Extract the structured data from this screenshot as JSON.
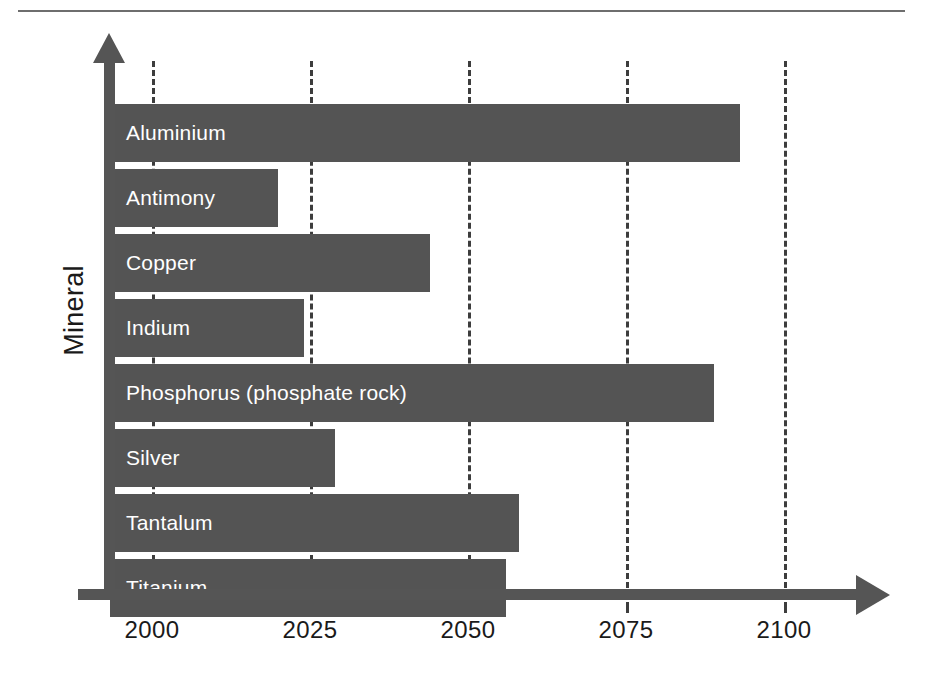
{
  "figure": {
    "background_color": "#ffffff",
    "bar_color": "#545454",
    "axis_color": "#555555",
    "grid_color": "#3d3d3d",
    "label_color": "#ffffff",
    "tick_label_color": "#1a1a1a",
    "top_rule": "divider"
  },
  "axes": {
    "y_title": "Mineral",
    "x_ticks": [
      "2000",
      "2025",
      "2050",
      "2075",
      "2100"
    ]
  },
  "chart_data": {
    "type": "bar",
    "orientation": "horizontal",
    "title": "",
    "xlabel": "",
    "ylabel": "Mineral",
    "xlim": [
      1992,
      2110
    ],
    "xticks": [
      2000,
      2025,
      2050,
      2075,
      2100
    ],
    "grid": true,
    "grid_axis": "x",
    "grid_style": "dashed",
    "legend": false,
    "categories": [
      "Aluminium",
      "Antimony",
      "Copper",
      "Indium",
      "Phosphorus (phosphate rock)",
      "Silver",
      "Tantalum",
      "Titanium"
    ],
    "values": [
      2093,
      2020,
      2044,
      2024,
      2089,
      2029,
      2058,
      2056
    ],
    "bars": [
      {
        "label": "Aluminium",
        "value": 2093
      },
      {
        "label": "Antimony",
        "value": 2020
      },
      {
        "label": "Copper",
        "value": 2044
      },
      {
        "label": "Indium",
        "value": 2024
      },
      {
        "label": "Phosphorus (phosphate rock)",
        "value": 2089
      },
      {
        "label": "Silver",
        "value": 2029
      },
      {
        "label": "Tantalum",
        "value": 2058
      },
      {
        "label": "Titanium",
        "value": 2056
      }
    ]
  }
}
